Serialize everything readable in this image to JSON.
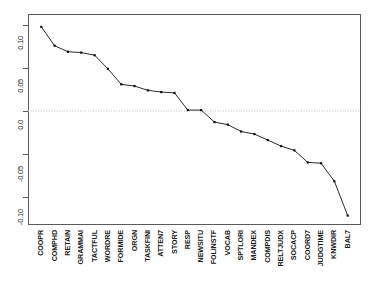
{
  "chart_data": {
    "type": "line",
    "title": "",
    "subtitle": "",
    "xlabel": "",
    "ylabel": "",
    "grid": false,
    "legend": "none",
    "zero_reference_line": 0.0,
    "ylim": [
      -0.133,
      0.113
    ],
    "yticks": [
      0.1,
      0.05,
      0.0,
      -0.05,
      -0.1
    ],
    "ytick_labels": [
      "0.10",
      "0.05",
      "0.0",
      "-0.05",
      "-0.10"
    ],
    "categories": [
      "COOPR",
      "COMPHD",
      "RETAIN",
      "GRAMMAI",
      "TACTFUL",
      "WORDRE",
      "FORMIDE",
      "ORGN",
      "TASKFINI",
      "ATTEN7",
      "STORY",
      "RESP",
      "NEWSITU",
      "FOLINSTF",
      "VOCAB",
      "SPTLORI",
      "MANDEX",
      "COMPDIS",
      "RELTJUDX",
      "SOCACP",
      "COORD7",
      "JUDGTIME",
      "KNWDIR",
      "BAL7"
    ],
    "values": [
      0.098,
      0.076,
      0.069,
      0.068,
      0.065,
      0.049,
      0.031,
      0.029,
      0.024,
      0.022,
      0.021,
      0.001,
      0.001,
      -0.013,
      -0.016,
      -0.024,
      -0.027,
      -0.034,
      -0.041,
      -0.046,
      -0.06,
      -0.061,
      -0.082,
      -0.122
    ],
    "marker": "square",
    "line_color": "#2b2b2b",
    "marker_color": "#111111",
    "zero_line_color": "#b9b9b9",
    "axis_color": "#5a5a5a"
  },
  "axis_geometry": {
    "plot_left": 28,
    "plot_right": 361,
    "plot_top": 14,
    "plot_bottom": 225
  }
}
